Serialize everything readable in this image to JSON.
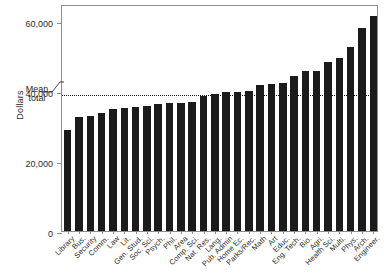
{
  "chart_data": {
    "type": "bar",
    "title": "",
    "xlabel": "",
    "ylabel": "Dollars",
    "ylim": [
      0,
      65000
    ],
    "yticks": [
      0,
      20000,
      40000,
      60000
    ],
    "ytick_labels": [
      "0",
      "20,000",
      "40,000",
      "60,000"
    ],
    "grid": false,
    "legend": null,
    "annotations": [
      {
        "name": "mean-total",
        "label_line1": "Mean",
        "label_line2": "total",
        "value": 39500,
        "style": "dotted horizontal reference line"
      }
    ],
    "bar_color": "#1b1b1b",
    "categories": [
      "Library",
      "Bus.",
      "Security",
      "Comm.",
      "Law",
      "Lit.",
      "Gen. Stud.",
      "Soc. Sci.",
      "Psych.",
      "Phil.",
      "Area",
      "Comp. Sci.",
      "Nat. Res.",
      "Lang.",
      "Pub. Admin",
      "Home Ec.",
      "Parks/Rec.",
      "Math",
      "Art",
      "Educ.",
      "Eng. Tech.",
      "Bio.",
      "Agri.",
      "Health Sci.",
      "Multi.",
      "Phys.",
      "Arch.",
      "Engineer."
    ],
    "values": [
      28800,
      32600,
      32800,
      33900,
      34800,
      35200,
      35500,
      35900,
      36300,
      36600,
      36700,
      37000,
      38800,
      39200,
      39700,
      39900,
      40100,
      41800,
      42000,
      42400,
      44300,
      45700,
      45700,
      48400,
      49600,
      52800,
      58000,
      61600
    ]
  },
  "axis": {
    "y_title": "Dollars"
  }
}
